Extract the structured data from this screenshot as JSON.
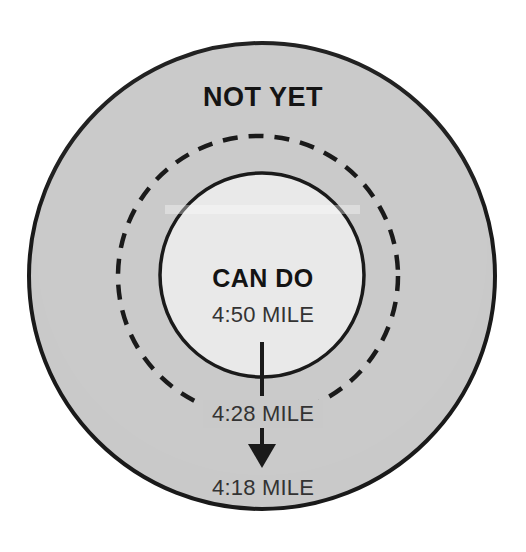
{
  "diagram": {
    "type": "concentric-zone-diagram",
    "background_color": "#ffffff",
    "rings": [
      {
        "id": "outer-ring",
        "name": "not-yet-zone",
        "label": "NOT YET",
        "fill_color": "#c9c9c9",
        "stroke_color": "#1a1a1a",
        "stroke_style": "solid",
        "center_x": 262,
        "center_y": 276,
        "diameter": 470
      },
      {
        "id": "dashed-ring",
        "name": "stretch-goal-boundary",
        "label": "4:28 MILE",
        "fill_color": "none",
        "stroke_color": "#1a1a1a",
        "stroke_style": "dashed",
        "center_x": 258,
        "center_y": 276,
        "diameter": 280
      },
      {
        "id": "inner-circle",
        "name": "can-do-zone",
        "label": "CAN DO",
        "fill_color": "#e9e9e9",
        "stroke_color": "#1a1a1a",
        "stroke_style": "solid",
        "center_x": 262,
        "center_y": 275,
        "diameter": 205
      }
    ],
    "labels": {
      "outer_zone_heading": "NOT YET",
      "inner_zone_heading": "CAN DO",
      "inner_zone_value": "4:50 MILE",
      "dashed_ring_value": "4:28 MILE",
      "outer_zone_value": "4:18 MILE"
    },
    "arrows": [
      {
        "id": "arrow-1",
        "name": "progress-arrow-inner-to-dashed",
        "from_label": "4:50 MILE",
        "to_label": "4:28 MILE",
        "head": "none",
        "color": "#1a1a1a"
      },
      {
        "id": "arrow-2",
        "name": "progress-arrow-dashed-to-outer",
        "from_label": "4:28 MILE",
        "to_label": "4:18 MILE",
        "head": "solid-triangle",
        "color": "#1a1a1a"
      }
    ]
  }
}
